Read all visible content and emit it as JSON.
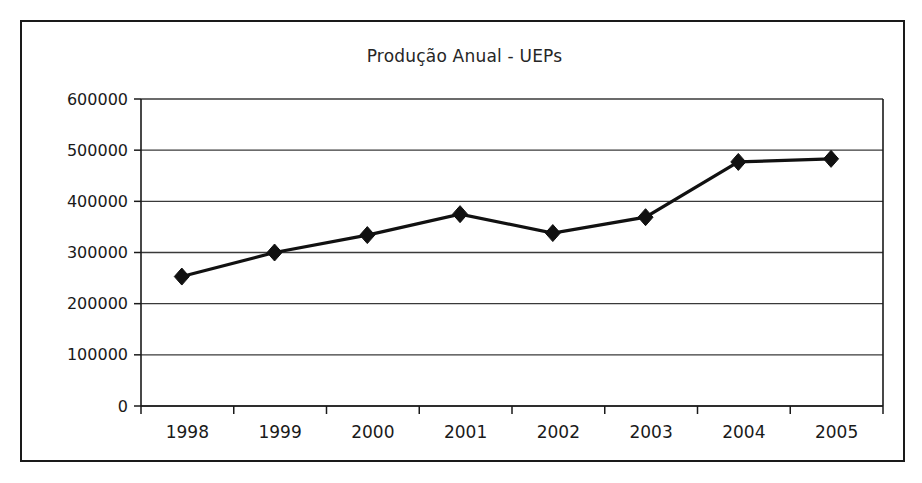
{
  "chart_data": {
    "type": "line",
    "title": "Produção Anual - UEPs",
    "xlabel": "",
    "ylabel": "",
    "categories": [
      "1998",
      "1999",
      "2000",
      "2001",
      "2002",
      "2003",
      "2004",
      "2005"
    ],
    "values": [
      253000,
      300000,
      334000,
      375000,
      338000,
      369000,
      477000,
      483000
    ],
    "series": [
      {
        "name": "Produção Anual - UEPs",
        "values": [
          253000,
          300000,
          334000,
          375000,
          338000,
          369000,
          477000,
          483000
        ]
      }
    ],
    "ylim": [
      0,
      600000
    ],
    "ytick_labels": [
      "0",
      "100000",
      "200000",
      "300000",
      "400000",
      "500000",
      "600000"
    ],
    "ytick_values": [
      0,
      100000,
      200000,
      300000,
      400000,
      500000,
      600000
    ],
    "xtick_labels": [
      "1998",
      "1999",
      "2000",
      "2001",
      "2002",
      "2003",
      "2004",
      "2005"
    ],
    "grid": true,
    "grid_axis": "y",
    "legend": false,
    "legend_position": "none",
    "marker": "diamond",
    "line_color": "#111111",
    "marker_color": "#111111",
    "grid_color": "#3a3a3a",
    "axis_color": "#1a1a1a",
    "background_color": "#ffffff",
    "border_color": "#1a1a1a"
  }
}
